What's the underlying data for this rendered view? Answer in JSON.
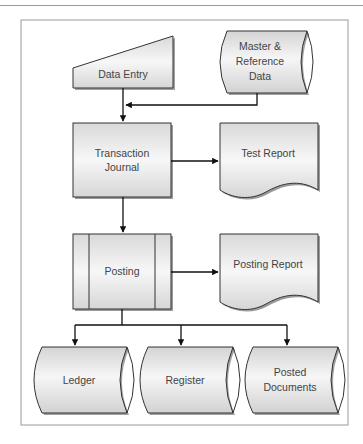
{
  "diagram": {
    "type": "flowchart",
    "nodes": {
      "data_entry": {
        "label_lines": [
          "Data Entry"
        ],
        "shape": "manual-input"
      },
      "master_data": {
        "label_lines": [
          "Master &",
          "Reference",
          "Data"
        ],
        "shape": "stored-data"
      },
      "transaction_journal": {
        "label_lines": [
          "Transaction",
          "Journal"
        ],
        "shape": "process"
      },
      "test_report": {
        "label_lines": [
          "Test Report"
        ],
        "shape": "document"
      },
      "posting": {
        "label_lines": [
          "Posting"
        ],
        "shape": "predefined-process"
      },
      "posting_report": {
        "label_lines": [
          "Posting Report"
        ],
        "shape": "document"
      },
      "ledger": {
        "label_lines": [
          "Ledger"
        ],
        "shape": "stored-data"
      },
      "register": {
        "label_lines": [
          "Register"
        ],
        "shape": "stored-data"
      },
      "posted_documents": {
        "label_lines": [
          "Posted",
          "Documents"
        ],
        "shape": "stored-data"
      }
    },
    "edges": [
      {
        "from": "Data Entry",
        "to": "Transaction Journal"
      },
      {
        "from": "Master & Reference Data",
        "to": "Transaction Journal"
      },
      {
        "from": "Transaction Journal",
        "to": "Test Report"
      },
      {
        "from": "Transaction Journal",
        "to": "Posting"
      },
      {
        "from": "Posting",
        "to": "Posting Report"
      },
      {
        "from": "Posting",
        "to": "Ledger"
      },
      {
        "from": "Posting",
        "to": "Register"
      },
      {
        "from": "Posting",
        "to": "Posted Documents"
      }
    ],
    "colors": {
      "stroke": "#333333",
      "fill_top": "#ffffff",
      "fill_bottom": "#d8d8d8",
      "shadow": "#8c8c8c",
      "text": "#444444"
    }
  }
}
